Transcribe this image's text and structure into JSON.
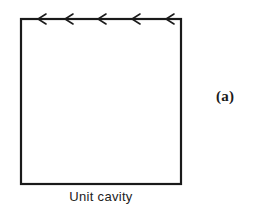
{
  "figure": {
    "panel_label": "(a)",
    "caption": "Unit cavity",
    "colors": {
      "stroke": "#1a1a1a",
      "background": "#ffffff"
    },
    "cavity_box": {
      "left": 21,
      "top": 19,
      "right": 181,
      "bottom": 184
    },
    "lid_arrows": {
      "direction": "left",
      "count": 5,
      "x_positions": [
        38,
        65,
        98,
        132,
        166
      ]
    }
  }
}
